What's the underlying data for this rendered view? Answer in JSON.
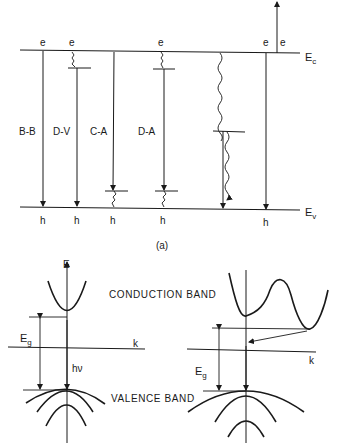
{
  "figure": {
    "panel_a": {
      "caption": "(a)",
      "band_edges": {
        "conduction": {
          "label": "E",
          "subscript": "c"
        },
        "valence": {
          "label": "E",
          "subscript": "v"
        }
      },
      "transitions": [
        {
          "label": "B-B",
          "top": "e",
          "bottom": "h"
        },
        {
          "label": "D-V",
          "top": "e",
          "bottom": "h"
        },
        {
          "label": "C-A",
          "top": "",
          "bottom": "h"
        },
        {
          "label": "D-A",
          "top": "e",
          "bottom": "h"
        },
        {
          "label": "",
          "top": "",
          "bottom": ""
        },
        {
          "label": "",
          "top": "e",
          "bottom": "h"
        }
      ],
      "escaping_electron": "e"
    },
    "panel_b": {
      "energy_axis": "E",
      "k_axis_left": "k",
      "k_axis_right": "k",
      "conduction_band": "CONDUCTION BAND",
      "valence_band": "VALENCE BAND",
      "gap_left": {
        "label": "E",
        "subscript": "g"
      },
      "gap_right": {
        "label": "E",
        "subscript": "g"
      },
      "photon": "hν"
    }
  }
}
